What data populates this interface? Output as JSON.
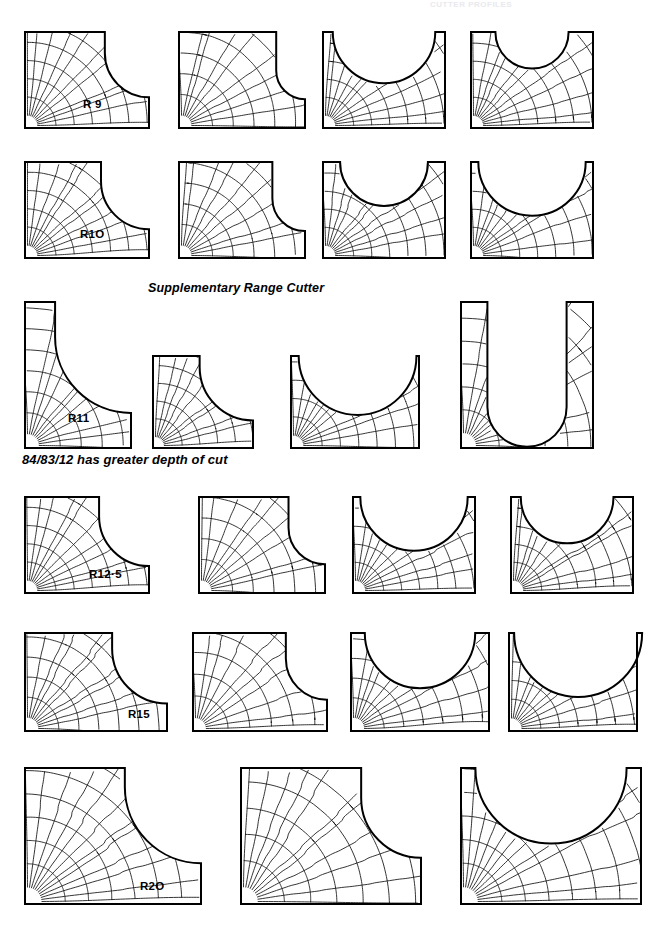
{
  "page": {
    "width": 660,
    "height": 926,
    "background": "#ffffff",
    "ink": "#000000",
    "faded_header_text": "CUTTER PROFILES"
  },
  "headings": [
    {
      "id": "supplementary",
      "text": "Supplementary Range Cutter",
      "x": 148,
      "y": 281
    },
    {
      "id": "depthofcut",
      "text": "84/83/12 has greater depth of cut",
      "x": 22,
      "y": 452
    }
  ],
  "radius_labels": [
    {
      "text": "R 9",
      "x": 83,
      "y": 98
    },
    {
      "text": "R1O",
      "x": 80,
      "y": 228
    },
    {
      "text": "R11",
      "x": 68,
      "y": 412
    },
    {
      "text": "R12·5",
      "x": 89,
      "y": 568
    },
    {
      "text": "R15",
      "x": 128,
      "y": 708
    },
    {
      "text": "R2O",
      "x": 140,
      "y": 880
    }
  ],
  "rows": [
    {
      "name": "row-r9",
      "label": "R 9",
      "y": 29,
      "height": 96,
      "figures": [
        {
          "name": "step-notch-large",
          "type": "corner-notch",
          "x": 22,
          "w": 124,
          "radius": 0.46,
          "shelf": 0.22,
          "mesh": 9
        },
        {
          "name": "step-notch-small",
          "type": "corner-notch",
          "x": 176,
          "w": 126,
          "radius": 0.3,
          "shelf": 0.4,
          "mesh": 8
        },
        {
          "name": "scallop-center",
          "type": "top-scallop",
          "x": 320,
          "w": 122,
          "radius": 0.42,
          "cx": 0.5,
          "mesh": 9
        },
        {
          "name": "scallop-narrow",
          "type": "top-scallop",
          "x": 468,
          "w": 122,
          "radius": 0.3,
          "cx": 0.5,
          "mesh": 9
        }
      ]
    },
    {
      "name": "row-r10",
      "label": "R1O",
      "y": 159,
      "height": 96,
      "figures": [
        {
          "name": "step-notch-large",
          "type": "corner-notch",
          "x": 22,
          "w": 124,
          "radius": 0.5,
          "shelf": 0.2,
          "mesh": 9
        },
        {
          "name": "step-notch-small",
          "type": "corner-notch",
          "x": 176,
          "w": 126,
          "radius": 0.34,
          "shelf": 0.38,
          "mesh": 8
        },
        {
          "name": "scallop-center",
          "type": "top-scallop",
          "x": 320,
          "w": 122,
          "radius": 0.36,
          "cx": 0.5,
          "mesh": 9
        },
        {
          "name": "scallop-wide",
          "type": "top-scallop",
          "x": 468,
          "w": 122,
          "radius": 0.44,
          "cx": 0.5,
          "mesh": 9
        }
      ]
    },
    {
      "name": "row-supplementary",
      "label": "R11",
      "y": 299,
      "height": 146,
      "figures": [
        {
          "name": "tall-step-notch",
          "type": "corner-notch",
          "x": 22,
          "w": 106,
          "h": 146,
          "radius": 0.52,
          "shelf": 0.24,
          "mesh": 9
        },
        {
          "name": "small-step-notch",
          "type": "corner-notch",
          "x": 150,
          "w": 100,
          "h": 92,
          "radius": 0.58,
          "shelf": 0.12,
          "mesh": 8,
          "yoff": 54
        },
        {
          "name": "scallop-wide",
          "type": "top-scallop",
          "x": 288,
          "w": 128,
          "h": 92,
          "radius": 0.46,
          "cx": 0.52,
          "mesh": 9,
          "yoff": 54
        },
        {
          "name": "u-slot-deep",
          "type": "u-slot",
          "x": 458,
          "w": 132,
          "h": 146,
          "radius": 0.3,
          "cx": 0.5,
          "depth": 0.72,
          "mesh": 9
        }
      ]
    },
    {
      "name": "row-r12-5",
      "label": "R12·5",
      "y": 494,
      "height": 96,
      "figures": [
        {
          "name": "step-notch-large",
          "type": "corner-notch",
          "x": 22,
          "w": 124,
          "radius": 0.52,
          "shelf": 0.2,
          "mesh": 9
        },
        {
          "name": "step-notch-small",
          "type": "corner-notch",
          "x": 196,
          "w": 126,
          "radius": 0.38,
          "shelf": 0.32,
          "mesh": 8
        },
        {
          "name": "scallop-deep",
          "type": "top-scallop",
          "x": 350,
          "w": 122,
          "radius": 0.44,
          "cx": 0.5,
          "mesh": 9
        },
        {
          "name": "scallop-shallow",
          "type": "top-scallop",
          "x": 508,
          "w": 122,
          "radius": 0.38,
          "cx": 0.46,
          "mesh": 9
        }
      ]
    },
    {
      "name": "row-r15",
      "label": "R15",
      "y": 630,
      "height": 98,
      "figures": [
        {
          "name": "step-notch-large",
          "type": "corner-notch",
          "x": 22,
          "w": 142,
          "radius": 0.56,
          "shelf": 0.16,
          "mesh": 9
        },
        {
          "name": "step-notch-small",
          "type": "corner-notch",
          "x": 190,
          "w": 134,
          "radius": 0.42,
          "shelf": 0.26,
          "mesh": 8
        },
        {
          "name": "scallop-center",
          "type": "top-scallop",
          "x": 348,
          "w": 138,
          "radius": 0.4,
          "cx": 0.5,
          "mesh": 9
        },
        {
          "name": "scallop-wide",
          "type": "top-scallop",
          "x": 506,
          "w": 128,
          "radius": 0.5,
          "cx": 0.54,
          "mesh": 9
        }
      ]
    },
    {
      "name": "row-r20",
      "label": "R2O",
      "y": 765,
      "height": 136,
      "figures": [
        {
          "name": "step-notch-large",
          "type": "corner-notch",
          "x": 22,
          "w": 176,
          "h": 136,
          "radius": 0.56,
          "shelf": 0.14,
          "mesh": 10
        },
        {
          "name": "step-notch-small",
          "type": "corner-notch",
          "x": 238,
          "w": 180,
          "h": 136,
          "radius": 0.44,
          "shelf": 0.22,
          "mesh": 9
        },
        {
          "name": "scallop-wide",
          "type": "top-scallop",
          "x": 458,
          "w": 180,
          "h": 136,
          "radius": 0.42,
          "cx": 0.5,
          "mesh": 10
        }
      ]
    }
  ]
}
